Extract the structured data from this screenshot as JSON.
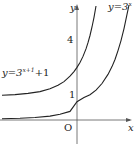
{
  "graph": {
    "axes": {
      "x_label": "x",
      "y_label": "y",
      "origin_label": "O"
    },
    "ticks": {
      "y_one": "1",
      "y_four": "4"
    },
    "curves": [
      {
        "name": "y=3^x",
        "label_prefix": "y=3",
        "label_exp": "x"
      },
      {
        "name": "y=3^(x+1)+1",
        "label_prefix": "y=3",
        "label_exp": "x+1",
        "label_suffix": "+1"
      }
    ]
  }
}
